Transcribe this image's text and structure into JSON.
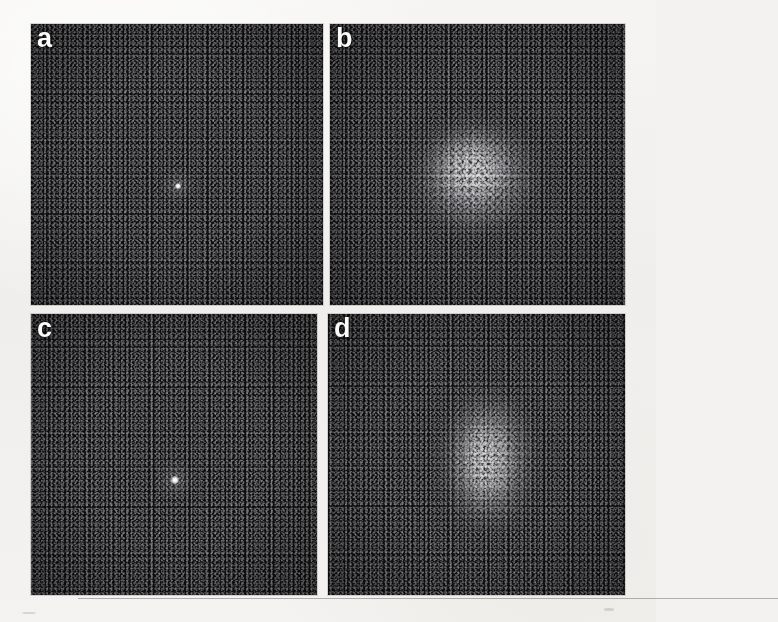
{
  "figure": {
    "kind": "micrograph-panel-figure",
    "background_color": "#f3f2f0",
    "panel_background_color": "#0b0b0c",
    "columns": 2,
    "rows": 2,
    "panels": [
      {
        "id": "a",
        "label": "a",
        "x": 31,
        "y": 24,
        "width": 292,
        "height": 281,
        "content": "dark-noise-field-with-bright-central-point",
        "feature": "sharp-central-bragg-spot",
        "feature_x_pct": 50.5,
        "feature_y_pct": 57.5,
        "feature_size_px": 5,
        "feature_color": "#ffffff"
      },
      {
        "id": "b",
        "label": "b",
        "x": 330,
        "y": 24,
        "width": 295,
        "height": 281,
        "content": "dark-noise-field-with-diffuse-speckle-cloud",
        "feature": "broad-diffuse-speckle-halo",
        "feature_x_pct": 49,
        "feature_y_pct": 54,
        "feature_width_px": 150,
        "feature_height_px": 138,
        "feature_color": "#d8d8dc"
      },
      {
        "id": "c",
        "label": "c",
        "x": 31,
        "y": 314,
        "width": 286,
        "height": 281,
        "content": "dark-noise-field-with-bright-central-point",
        "feature": "sharp-central-bragg-spot",
        "feature_x_pct": 50.5,
        "feature_y_pct": 59,
        "feature_size_px": 7,
        "feature_color": "#ffffff"
      },
      {
        "id": "d",
        "label": "d",
        "x": 328,
        "y": 314,
        "width": 297,
        "height": 281,
        "content": "dark-noise-field-with-elongated-diffuse-cloud",
        "feature": "vertically-elongated-diffuse-speckle-halo",
        "feature_x_pct": 54,
        "feature_y_pct": 52,
        "feature_width_px": 116,
        "feature_height_px": 170,
        "feature_color": "#cfcfd4"
      }
    ]
  }
}
